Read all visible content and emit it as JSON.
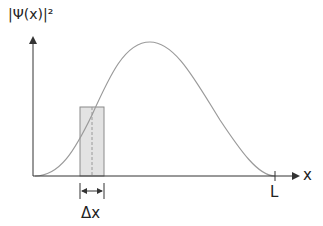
{
  "diagram": {
    "y_axis_label": "|Ψ(x)|²",
    "x_axis_label": "x",
    "x_end_label": "L",
    "interval_label": "Δx",
    "colors": {
      "axis": "#333333",
      "curve": "#9a9a9a",
      "shade_fill": "#e3e3e3",
      "shade_stroke": "#8a8a8a"
    }
  }
}
